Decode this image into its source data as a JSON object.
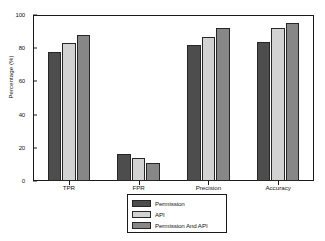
{
  "chart_data": {
    "type": "bar",
    "title": "",
    "xlabel": "",
    "ylabel": "Percentage (%)",
    "categories": [
      "TPR",
      "FPR",
      "Precision",
      "Accuracy"
    ],
    "series": [
      {
        "name": "Permission",
        "color": "#4d4d4d",
        "values": [
          78,
          16,
          82,
          84
        ]
      },
      {
        "name": "API",
        "color": "#d2d2d2",
        "values": [
          83,
          14,
          87,
          92
        ]
      },
      {
        "name": "Permission And API",
        "color": "#878787",
        "values": [
          88,
          11,
          92,
          95
        ]
      }
    ],
    "ylim": [
      0,
      100
    ],
    "yticks": [
      0,
      20,
      40,
      60,
      80,
      100
    ],
    "ytick_labels": [
      "0",
      "20",
      "40",
      "60",
      "80",
      "100"
    ],
    "grid": false,
    "legend_position": "below-axes-center",
    "axes_color": "#1a1a1a",
    "background": "#ffffff"
  }
}
